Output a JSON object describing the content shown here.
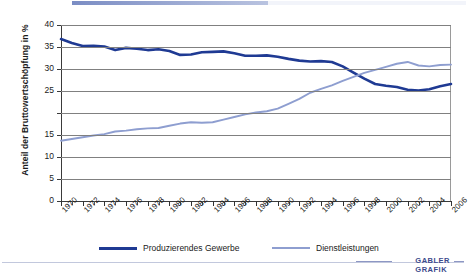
{
  "chart_data": {
    "type": "line",
    "title": "",
    "xlabel": "",
    "ylabel": "Anteil der Bruttowertschöpfung in %",
    "ylim": [
      0,
      40
    ],
    "xlim": [
      1970,
      2006
    ],
    "grid": true,
    "legend_position": "bottom",
    "ytick_labels": [
      "0",
      "5",
      "10",
      "15",
      "",
      "25",
      "30",
      "35",
      "40"
    ],
    "ytick_values": [
      0,
      5,
      10,
      15,
      20,
      25,
      30,
      35,
      40
    ],
    "xtick_labels": [
      "1970",
      "1972",
      "1974",
      "1976",
      "1978",
      "1980",
      "1982",
      "1984",
      "1986",
      "1988",
      "1990",
      "1992",
      "1994",
      "1996",
      "1998",
      "2000",
      "2002",
      "2004",
      "2006"
    ],
    "x": [
      1970,
      1971,
      1972,
      1973,
      1974,
      1975,
      1976,
      1977,
      1978,
      1979,
      1980,
      1981,
      1982,
      1983,
      1984,
      1985,
      1986,
      1987,
      1988,
      1989,
      1990,
      1991,
      1992,
      1993,
      1994,
      1995,
      1996,
      1997,
      1998,
      1999,
      2000,
      2001,
      2002,
      2003,
      2004,
      2005,
      2006
    ],
    "series": [
      {
        "name": "Produzierendes Gewerbe",
        "color": "#1f3a93",
        "values": [
          36.8,
          35.9,
          35.2,
          35.3,
          35.1,
          34.3,
          34.8,
          34.6,
          34.3,
          34.5,
          34.1,
          33.2,
          33.3,
          33.8,
          33.9,
          34.0,
          33.6,
          33.0,
          33.0,
          33.1,
          32.8,
          32.3,
          31.9,
          31.7,
          31.8,
          31.6,
          30.6,
          29.2,
          27.8,
          26.6,
          26.2,
          25.9,
          25.3,
          25.1,
          25.4,
          26.1,
          26.6
        ]
      },
      {
        "name": "Dienstleistungen",
        "color": "#8e9ed0",
        "values": [
          13.7,
          14.1,
          14.5,
          14.9,
          15.2,
          15.8,
          16.0,
          16.3,
          16.5,
          16.6,
          17.1,
          17.6,
          17.9,
          17.8,
          17.9,
          18.5,
          19.1,
          19.7,
          20.1,
          20.4,
          21.0,
          22.1,
          23.2,
          24.6,
          25.5,
          26.3,
          27.3,
          28.2,
          29.1,
          29.8,
          30.5,
          31.2,
          31.6,
          30.8,
          30.6,
          30.9,
          31.0
        ]
      }
    ]
  },
  "legend": {
    "items": [
      {
        "label": "Produzierendes Gewerbe",
        "color": "#1f3a93"
      },
      {
        "label": "Dienstleistungen",
        "color": "#8e9ed0"
      }
    ]
  },
  "brand": {
    "line1": "GABLER",
    "line2": "GRAFIK"
  }
}
